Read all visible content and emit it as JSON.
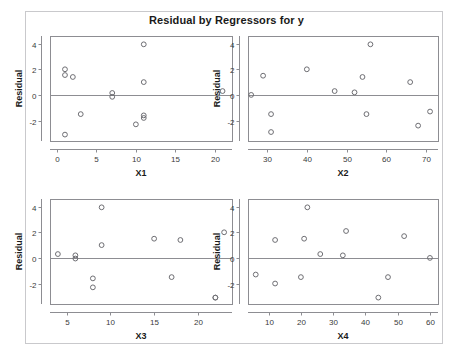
{
  "figure": {
    "title": "Residual by Regressors for y",
    "background": "#ffffff",
    "frame_color": "#c9c9cc",
    "axis_color": "#8d8d92",
    "marker_color": "#6e6e73"
  },
  "chart_data": [
    {
      "type": "scatter",
      "title": "Residual by Regressors for y",
      "panel": "top-left",
      "xlabel": "X1",
      "ylabel": "Residual",
      "xlim": [
        -0.9,
        22.2
      ],
      "ylim": [
        -3.6,
        4.6
      ],
      "xticks": [
        0,
        5,
        10,
        15,
        20
      ],
      "yticks": [
        4,
        2,
        0,
        -2
      ],
      "xtick_labels": [
        "0",
        "5",
        "10",
        "15",
        "20"
      ],
      "ytick_labels": [
        "4",
        "2",
        "0",
        "-2"
      ],
      "grid": false,
      "reference_line_y": 0,
      "x": [
        1,
        1,
        2,
        3,
        7,
        7,
        10,
        11,
        11,
        11,
        11,
        21,
        1
      ],
      "y": [
        2.0,
        1.55,
        1.4,
        -1.5,
        0.15,
        -0.15,
        -2.3,
        3.95,
        1.0,
        -1.6,
        -1.8,
        0.3,
        -3.1
      ]
    },
    {
      "type": "scatter",
      "title": "Residual by Regressors for y",
      "panel": "top-right",
      "xlabel": "X2",
      "ylabel": "Residual",
      "xlim": [
        25.2,
        73.0
      ],
      "ylim": [
        -3.6,
        4.6
      ],
      "xticks": [
        30,
        40,
        50,
        60,
        70
      ],
      "yticks": [
        4,
        2,
        0,
        -2
      ],
      "xtick_labels": [
        "30",
        "40",
        "50",
        "60",
        "70"
      ],
      "ytick_labels": [
        "4",
        "2",
        "0",
        "-2"
      ],
      "grid": false,
      "reference_line_y": 0,
      "x": [
        26,
        29,
        31,
        31,
        40,
        47,
        52,
        54,
        55,
        56,
        66,
        68,
        71
      ],
      "y": [
        0.0,
        1.5,
        -1.5,
        -2.9,
        2.0,
        0.3,
        0.2,
        1.4,
        -1.5,
        3.95,
        1.0,
        -2.4,
        -1.3
      ]
    },
    {
      "type": "scatter",
      "title": "Residual by Regressors for y",
      "panel": "bottom-left",
      "xlabel": "X3",
      "ylabel": "Residual",
      "xlim": [
        3.1,
        23.9
      ],
      "ylim": [
        -3.6,
        4.6
      ],
      "xticks": [
        5,
        10,
        15,
        20
      ],
      "yticks": [
        4,
        2,
        0,
        -2
      ],
      "xtick_labels": [
        "5",
        "10",
        "15",
        "20"
      ],
      "ytick_labels": [
        "4",
        "2",
        "0",
        "-2"
      ],
      "grid": false,
      "reference_line_y": 0,
      "x": [
        4,
        6,
        6,
        8,
        8,
        9,
        9,
        15,
        17,
        18,
        22,
        23,
        22
      ],
      "y": [
        0.3,
        0.2,
        -0.05,
        -1.6,
        -2.3,
        3.95,
        1.0,
        1.5,
        -1.5,
        1.4,
        -3.1,
        2.0,
        -3.1
      ]
    },
    {
      "type": "scatter",
      "title": "Residual by Regressors for y",
      "panel": "bottom-right",
      "xlabel": "X4",
      "ylabel": "Residual",
      "xlim": [
        3.6,
        62.5
      ],
      "ylim": [
        -3.6,
        4.6
      ],
      "xticks": [
        10,
        20,
        30,
        40,
        50,
        60
      ],
      "yticks": [
        4,
        2,
        0,
        -2
      ],
      "xtick_labels": [
        "10",
        "20",
        "30",
        "40",
        "50",
        "60"
      ],
      "ytick_labels": [
        "4",
        "2",
        "0",
        "-2"
      ],
      "grid": false,
      "reference_line_y": 0,
      "x": [
        6,
        12,
        12,
        20,
        21,
        22,
        26,
        33,
        34,
        44,
        47,
        52,
        60
      ],
      "y": [
        -1.3,
        1.4,
        -2.0,
        -1.5,
        1.5,
        3.95,
        0.3,
        0.2,
        2.1,
        -3.1,
        -1.5,
        1.7,
        0.0
      ]
    }
  ]
}
